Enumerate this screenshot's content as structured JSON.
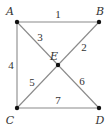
{
  "diagram": {
    "type": "graph",
    "colors": {
      "edge": "#8a8a8a",
      "node": "#111111",
      "text": "#333333"
    },
    "vertices": [
      {
        "id": "A",
        "label": "A",
        "x": 17,
        "y": 22,
        "lx": 10,
        "ly": 15
      },
      {
        "id": "B",
        "label": "B",
        "x": 99,
        "y": 22,
        "lx": 100,
        "ly": 15
      },
      {
        "id": "C",
        "label": "C",
        "x": 17,
        "y": 108,
        "lx": 10,
        "ly": 124
      },
      {
        "id": "D",
        "label": "D",
        "x": 99,
        "y": 108,
        "lx": 100,
        "ly": 124
      },
      {
        "id": "E",
        "label": "E",
        "x": 58,
        "y": 65,
        "lx": 54,
        "ly": 60
      }
    ],
    "edges": [
      {
        "from": "A",
        "to": "B",
        "label": "1",
        "lx": 58,
        "ly": 18
      },
      {
        "from": "B",
        "to": "E",
        "label": "2",
        "lx": 84,
        "ly": 51
      },
      {
        "from": "A",
        "to": "E",
        "label": "3",
        "lx": 40,
        "ly": 41
      },
      {
        "from": "A",
        "to": "C",
        "label": "4",
        "lx": 11,
        "ly": 69
      },
      {
        "from": "C",
        "to": "E",
        "label": "5",
        "lx": 32,
        "ly": 86
      },
      {
        "from": "E",
        "to": "D",
        "label": "6",
        "lx": 82,
        "ly": 85
      },
      {
        "from": "C",
        "to": "D",
        "label": "7",
        "lx": 58,
        "ly": 104
      }
    ]
  }
}
